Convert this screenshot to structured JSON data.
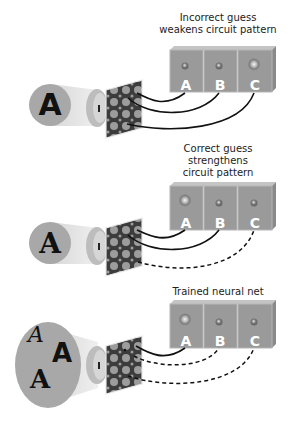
{
  "panels": [
    {
      "title": "Incorrect guess\nweakens circuit pattern",
      "input_letters": [
        "A"
      ],
      "outputs": [
        {
          "label": "A",
          "active": false,
          "link": "solid"
        },
        {
          "label": "B",
          "active": false,
          "link": "solid"
        },
        {
          "label": "C",
          "active": true,
          "link": "solid"
        }
      ]
    },
    {
      "title": "Correct guess\nstrengthens\ncircuit pattern",
      "input_letters": [
        "A"
      ],
      "outputs": [
        {
          "label": "A",
          "active": true,
          "link": "solid"
        },
        {
          "label": "B",
          "active": false,
          "link": "solid"
        },
        {
          "label": "C",
          "active": false,
          "link": "dashed"
        }
      ]
    },
    {
      "title": "Trained neural net",
      "input_letters": [
        "A",
        "A",
        "A"
      ],
      "outputs": [
        {
          "label": "A",
          "active": true,
          "link": "solid"
        },
        {
          "label": "B",
          "active": false,
          "link": "dashed"
        },
        {
          "label": "C",
          "active": false,
          "link": "dashed"
        }
      ]
    }
  ],
  "colors": {
    "box": "#9a9a9a",
    "box_top": "#bdbdbd",
    "circle": "#a8a8a8",
    "beam": "#e6e6e6",
    "grid_dark": "#3c3c3c",
    "grid_dot": "#9c9c9c",
    "wire": "#111111"
  }
}
